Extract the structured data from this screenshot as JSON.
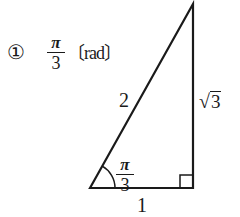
{
  "answer": {
    "marker": "①",
    "fraction": {
      "numerator": "π",
      "denominator": "3"
    },
    "unit": "〔rad〕"
  },
  "triangle": {
    "hypotenuse_label": "2",
    "vertical_side_label": {
      "radical": "√",
      "radicand": "3"
    },
    "base_label": "1",
    "angle_label": {
      "numerator": "π",
      "denominator": "3"
    },
    "right_angle_mark": true,
    "stroke_color": "#1a1a1a"
  }
}
